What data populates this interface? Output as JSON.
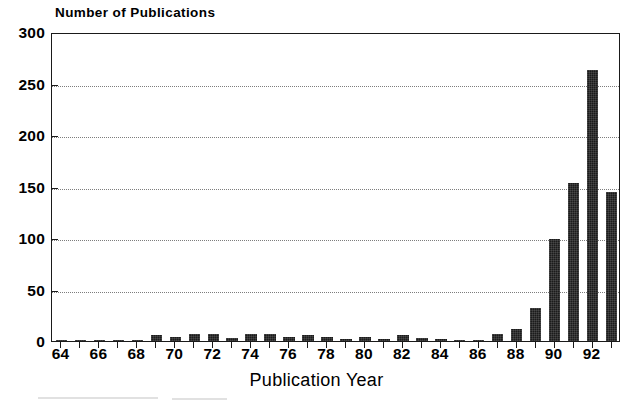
{
  "chart_data": {
    "type": "bar",
    "title": "",
    "ylabel": "Number of Publications",
    "xlabel": "Publication Year",
    "ylim": [
      0,
      300
    ],
    "yticks": [
      0,
      50,
      100,
      150,
      200,
      250,
      300
    ],
    "ytick_labels": [
      "0",
      "50",
      "100",
      "150",
      "200",
      "250",
      "300"
    ],
    "xticks": [
      64,
      66,
      68,
      70,
      72,
      74,
      76,
      78,
      80,
      82,
      84,
      86,
      88,
      90,
      92
    ],
    "xtick_labels": [
      "64",
      "66",
      "68",
      "70",
      "72",
      "74",
      "76",
      "78",
      "80",
      "82",
      "84",
      "86",
      "88",
      "90",
      "92"
    ],
    "grid": true,
    "legend": null,
    "categories": [
      64,
      65,
      66,
      67,
      68,
      69,
      70,
      71,
      72,
      73,
      74,
      75,
      76,
      77,
      78,
      79,
      80,
      81,
      82,
      83,
      84,
      85,
      86,
      87,
      88,
      89,
      90,
      91,
      92,
      93
    ],
    "values": [
      1,
      1,
      1,
      1,
      1,
      6,
      4,
      7,
      7,
      3,
      7,
      7,
      4,
      6,
      4,
      2,
      4,
      2,
      6,
      3,
      2,
      1,
      1,
      7,
      12,
      32,
      99,
      153,
      263,
      145
    ],
    "bar_color": "#1b1b1b"
  },
  "axes": {
    "y_title": "Number of Publications",
    "x_title": "Publication Year"
  }
}
